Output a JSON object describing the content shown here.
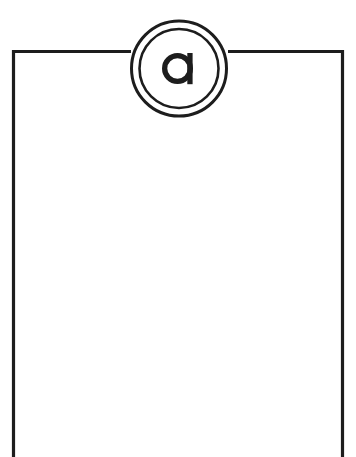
{
  "figure": {
    "canvas": {
      "width": 356,
      "height": 457,
      "background_color": "#ffffff"
    },
    "stroke": {
      "color": "#1d1d1d",
      "width": 3.2
    },
    "enclosure": {
      "name": "open-bottom-rectangle",
      "left_x": 13.5,
      "right_x": 342.5,
      "top_y": 51.5,
      "bottom_open": true,
      "bottom_extends_to_y": 457,
      "top_edge_gap_start_x": 131,
      "top_edge_gap_end_x": 228
    },
    "callout": {
      "name": "reference-callout-a",
      "label": "a",
      "center_x": 179,
      "center_y": 68.5,
      "outer_radius": 47.5,
      "inner_radius": 39.5,
      "letter_font_size": 46,
      "letter_style": "single-story-geometric-lowercase"
    }
  }
}
